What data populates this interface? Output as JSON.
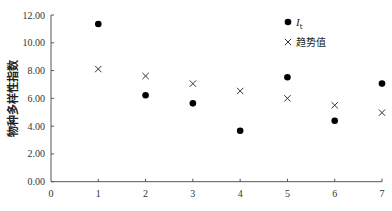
{
  "chart_data": {
    "type": "scatter",
    "title": "",
    "xlabel": "",
    "ylabel": "物种多样性指数",
    "xlim": [
      0,
      7
    ],
    "ylim": [
      0,
      12
    ],
    "x_ticks": [
      "0",
      "1",
      "2",
      "3",
      "4",
      "5",
      "6",
      "7"
    ],
    "y_ticks": [
      "0.00",
      "2.00",
      "4.00",
      "6.00",
      "8.00",
      "10.00",
      "12.00"
    ],
    "grid": false,
    "legend_position": "top-right",
    "x": [
      1,
      2,
      3,
      4,
      5,
      6,
      7
    ],
    "series": [
      {
        "name": "I_t",
        "label_main": "I",
        "label_sub": "t",
        "marker": "circle",
        "color": "#000000",
        "values": [
          11.35,
          6.22,
          5.64,
          3.67,
          7.52,
          4.39,
          7.06
        ]
      },
      {
        "name": "趋势值",
        "marker": "x",
        "color": "#333333",
        "values": [
          8.11,
          7.61,
          7.06,
          6.53,
          6.0,
          5.5,
          4.97
        ]
      }
    ]
  }
}
